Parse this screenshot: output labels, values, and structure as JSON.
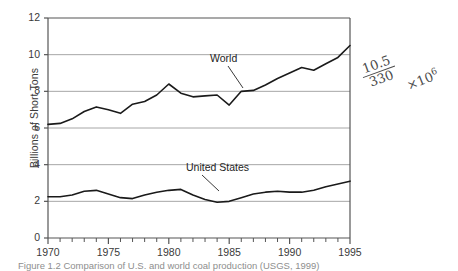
{
  "chart_data": {
    "type": "line",
    "title": "",
    "xlabel": "",
    "ylabel": "Billions of Short Tons",
    "xlim": [
      1970,
      1995
    ],
    "ylim": [
      0,
      12
    ],
    "ytick_labels": [
      "0",
      "2",
      "4",
      "6",
      "8",
      "10",
      "12"
    ],
    "ytick_values": [
      0,
      2,
      4,
      6,
      8,
      10,
      12
    ],
    "xtick_labels": [
      "1970",
      "1975",
      "1980",
      "1985",
      "1990",
      "1995"
    ],
    "xtick_values": [
      1970,
      1975,
      1980,
      1985,
      1990,
      1995
    ],
    "minor_xticks_every": 1,
    "grid": "horizontal",
    "legend": "inline-annotations",
    "x": [
      1970,
      1971,
      1972,
      1973,
      1974,
      1975,
      1976,
      1977,
      1978,
      1979,
      1980,
      1981,
      1982,
      1983,
      1984,
      1985,
      1986,
      1987,
      1988,
      1989,
      1990,
      1991,
      1992,
      1993,
      1994,
      1995
    ],
    "series": [
      {
        "name": "World",
        "values": [
          6.2,
          6.25,
          6.5,
          6.9,
          7.15,
          7.0,
          6.8,
          7.3,
          7.45,
          7.8,
          8.4,
          7.9,
          7.7,
          7.75,
          7.8,
          7.25,
          8.0,
          8.05,
          8.35,
          8.7,
          9.0,
          9.3,
          9.15,
          9.5,
          9.85,
          10.5
        ]
      },
      {
        "name": "United States",
        "values": [
          2.25,
          2.25,
          2.35,
          2.55,
          2.6,
          2.4,
          2.2,
          2.15,
          2.35,
          2.5,
          2.6,
          2.65,
          2.35,
          2.1,
          1.95,
          2.0,
          2.2,
          2.4,
          2.5,
          2.55,
          2.5,
          2.5,
          2.6,
          2.8,
          2.95,
          3.1
        ]
      }
    ]
  },
  "annotations": {
    "world_label": "World",
    "us_label": "United States",
    "handwritten": {
      "numerator": "10.5",
      "denominator": "330",
      "multiplier": "×10",
      "exponent": "6"
    }
  },
  "caption": {
    "text": "Figure 1.2   Comparison of U.S. and world coal production (USGS, 1999)"
  },
  "colors": {
    "series_line": "#1a1a1a",
    "gridline": "#a6a6a6",
    "axis": "#555555",
    "text": "#3a3a3a",
    "background": "#ffffff"
  }
}
